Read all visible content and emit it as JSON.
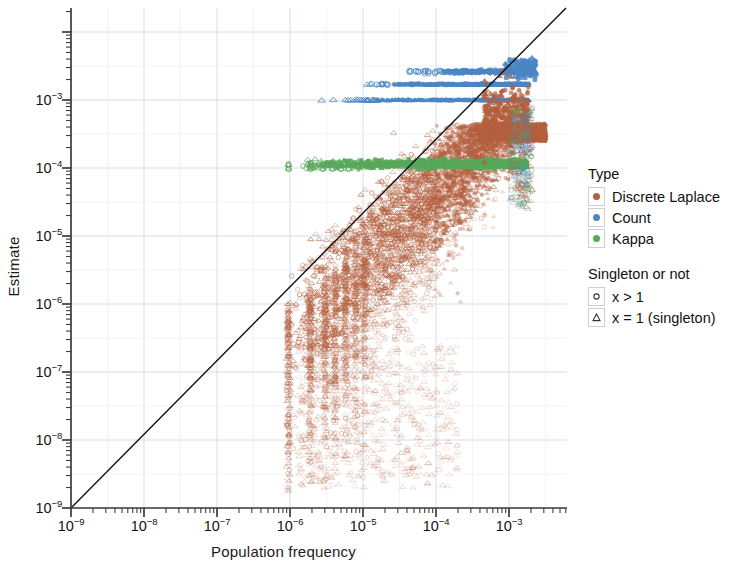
{
  "chart_data": {
    "type": "scatter",
    "title": "",
    "xlabel": "Population frequency",
    "ylabel": "Estimate",
    "xscale": "log",
    "yscale": "log",
    "xlim": [
      1e-09,
      0.0035
    ],
    "ylim": [
      1e-09,
      0.004
    ],
    "xticks": [
      "10−9",
      "10−8",
      "10−7",
      "10−6",
      "10−5",
      "10−4",
      "10−3"
    ],
    "xtick_values": [
      1e-09,
      1e-08,
      1e-07,
      1e-06,
      1e-05,
      0.0001,
      0.001
    ],
    "yticks": [
      "10−9",
      "10−8",
      "10−7",
      "10−6",
      "10−5",
      "10−4",
      "10−3"
    ],
    "ytick_values": [
      1e-09,
      1e-08,
      1e-07,
      1e-06,
      1e-05,
      0.0001,
      0.001
    ],
    "grid": true,
    "legend_position": "right",
    "reference_line": {
      "name": "identity",
      "description": "y = x diagonal",
      "from": [
        1e-09,
        1e-09
      ],
      "to": [
        0.0035,
        0.0035
      ],
      "color": "#000000"
    },
    "series": [
      {
        "name": "Discrete Laplace",
        "color": "#b4603f",
        "description": "Diffuse cloud rising along the identity line from ~1e-6 population frequency; wide vertical spread below the line at low frequencies, converging near the line at high frequencies.",
        "x_range": [
          8e-07,
          0.0032
        ],
        "y_range": [
          3e-09,
          0.0035
        ],
        "n_points_approx": 6000
      },
      {
        "name": "Count",
        "color": "#4a86c4",
        "description": "Three discrete horizontal bands of constant estimate; the lowest band sits exactly at 1e-3 (singletons), with higher quantized bands above.",
        "bands": [
          0.001,
          0.0017,
          0.0026
        ],
        "x_range": [
          2.2e-06,
          0.0032
        ],
        "n_points_approx": 900
      },
      {
        "name": "Kappa",
        "color": "#58a85a",
        "description": "Single dense horizontal band just above 1e-4, extending from ~1e-6 to the right edge.",
        "bands": [
          0.000115
        ],
        "x_range": [
          9e-07,
          0.0032
        ],
        "n_points_approx": 1400
      }
    ],
    "shape_encoding": {
      "title": "Singleton or not",
      "levels": [
        {
          "label": "x > 1",
          "marker": "circle"
        },
        {
          "label": "x = 1 (singleton)",
          "marker": "triangle"
        }
      ]
    }
  },
  "axes": {
    "x": {
      "label": "Population frequency",
      "ticks": [
        {
          "label_base": "10",
          "label_exp": "−9"
        },
        {
          "label_base": "10",
          "label_exp": "−8"
        },
        {
          "label_base": "10",
          "label_exp": "−7"
        },
        {
          "label_base": "10",
          "label_exp": "−6"
        },
        {
          "label_base": "10",
          "label_exp": "−5"
        },
        {
          "label_base": "10",
          "label_exp": "−4"
        },
        {
          "label_base": "10",
          "label_exp": "−3"
        }
      ]
    },
    "y": {
      "label": "Estimate",
      "ticks": [
        {
          "label_base": "10",
          "label_exp": "−3"
        },
        {
          "label_base": "10",
          "label_exp": "−4"
        },
        {
          "label_base": "10",
          "label_exp": "−5"
        },
        {
          "label_base": "10",
          "label_exp": "−6"
        },
        {
          "label_base": "10",
          "label_exp": "−7"
        },
        {
          "label_base": "10",
          "label_exp": "−8"
        },
        {
          "label_base": "10",
          "label_exp": "−9"
        }
      ]
    }
  },
  "legend": {
    "type": {
      "title": "Type",
      "items": [
        {
          "label": "Discrete Laplace",
          "color": "#b4603f"
        },
        {
          "label": "Count",
          "color": "#4a86c4"
        },
        {
          "label": "Kappa",
          "color": "#58a85a"
        }
      ]
    },
    "singleton": {
      "title": "Singleton or not",
      "items": [
        {
          "label": "x > 1",
          "marker": "circle"
        },
        {
          "label": "x = 1 (singleton)",
          "marker": "triangle"
        }
      ]
    }
  },
  "colors": {
    "discrete_laplace": "#b4603f",
    "count": "#4a86c4",
    "kappa": "#58a85a",
    "grid": "#c8d6e0",
    "axis": "#3d3d3d",
    "reference_line": "#111111"
  }
}
